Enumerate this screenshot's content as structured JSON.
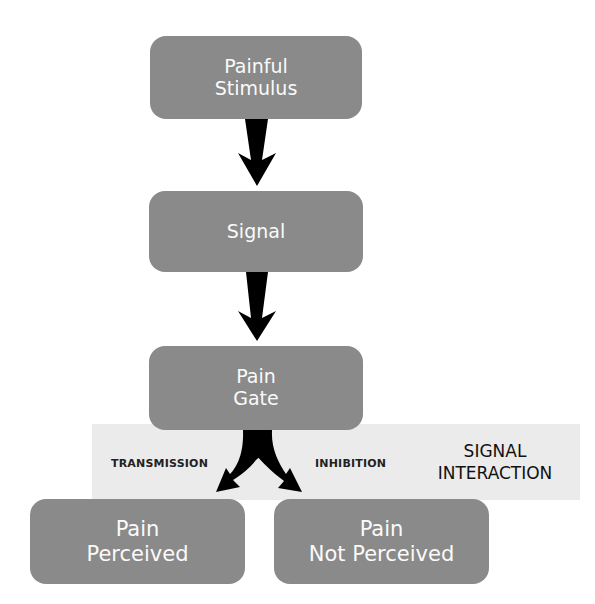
{
  "diagram": {
    "nodes": {
      "stimulus": {
        "line1": "Painful",
        "line2": "Stimulus"
      },
      "signal": {
        "line1": "Signal"
      },
      "gate": {
        "line1": "Pain",
        "line2": "Gate"
      },
      "perceived": {
        "line1": "Pain",
        "line2": "Perceived"
      },
      "not_perceived": {
        "line1": "Pain",
        "line2": "Not Perceived"
      }
    },
    "edge_labels": {
      "left": "TRANSMISSION",
      "right": "INHIBITION"
    },
    "band_title": {
      "line1": "SIGNAL",
      "line2": "INTERACTION"
    },
    "colors": {
      "box": "#8a8a8a",
      "band": "#ebebeb",
      "arrow": "#000000",
      "text": "#fafafa"
    }
  }
}
